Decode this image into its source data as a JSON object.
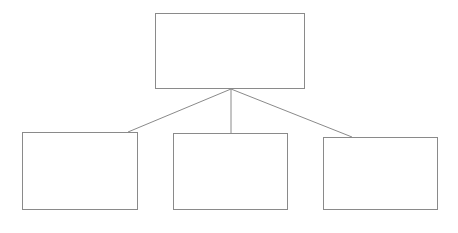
{
  "diagram": {
    "type": "hierarchy-tree",
    "title": "",
    "canvas": {
      "width": 458,
      "height": 233,
      "background_color": "#ffffff"
    },
    "style": {
      "box_border_color": "#8a8a8a",
      "box_border_width": 1,
      "box_fill_color": "#ffffff",
      "connector_color": "#8a8a8a",
      "connector_width": 1
    },
    "junction": {
      "x": 231,
      "y": 89
    },
    "nodes": [
      {
        "id": "root",
        "role": "parent",
        "label": "",
        "x": 155,
        "y": 13,
        "width": 150,
        "height": 76
      },
      {
        "id": "child-1",
        "role": "child",
        "label": "",
        "x": 22,
        "y": 132,
        "width": 116,
        "height": 78
      },
      {
        "id": "child-2",
        "role": "child",
        "label": "",
        "x": 173,
        "y": 133,
        "width": 115,
        "height": 77
      },
      {
        "id": "child-3",
        "role": "child",
        "label": "",
        "x": 323,
        "y": 137,
        "width": 115,
        "height": 73
      }
    ],
    "connectors": [
      {
        "id": "connector-root-to-child-1",
        "from": "root",
        "to": "child-1",
        "x1": 231,
        "y1": 89,
        "x2": 128,
        "y2": 132
      },
      {
        "id": "connector-root-to-child-2",
        "from": "root",
        "to": "child-2",
        "x1": 231,
        "y1": 89,
        "x2": 231,
        "y2": 133
      },
      {
        "id": "connector-root-to-child-3",
        "from": "root",
        "to": "child-3",
        "x1": 231,
        "y1": 89,
        "x2": 352,
        "y2": 137
      }
    ]
  }
}
